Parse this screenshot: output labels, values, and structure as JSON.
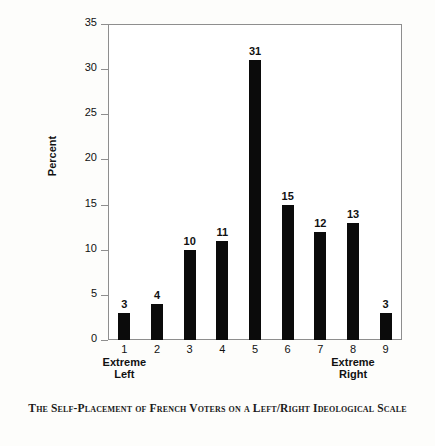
{
  "caption": "The Self-Placement of French Voters on a Left/Right Ideological Scale",
  "axes": {
    "ylabel": "Percent",
    "yticks": [
      "0",
      "5",
      "10",
      "15",
      "20",
      "25",
      "30",
      "35"
    ]
  },
  "colors": {
    "bar": "#0b0b0b",
    "frame": "#8e8e8e",
    "text": "#111111",
    "background": "#fdfdfb"
  },
  "chart_data": {
    "type": "bar",
    "title": "The Self-Placement of French Voters on a Left/Right Ideological Scale",
    "xlabel": "",
    "ylabel": "Percent",
    "categories": [
      "1",
      "2",
      "3",
      "4",
      "5",
      "6",
      "7",
      "8",
      "9"
    ],
    "values": [
      3,
      4,
      10,
      11,
      31,
      15,
      12,
      13,
      3
    ],
    "data_labels": [
      "3",
      "4",
      "10",
      "11",
      "31",
      "15",
      "12",
      "13",
      "3"
    ],
    "ylim": [
      0,
      35
    ],
    "ytick_step": 5,
    "yticks": [
      0,
      5,
      10,
      15,
      20,
      25,
      30,
      35
    ],
    "grid": false,
    "legend": null,
    "annotations": [
      {
        "text": "Extreme Left",
        "line1": "Extreme",
        "line2": "Left",
        "under_category": "1"
      },
      {
        "text": "Extreme Right",
        "line1": "Extreme",
        "line2": "Right",
        "under_category": "8"
      }
    ]
  }
}
